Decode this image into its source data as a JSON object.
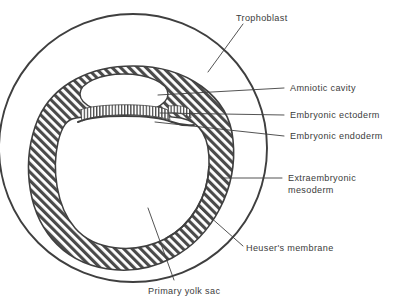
{
  "figure": {
    "type": "anatomical-cross-section",
    "colors": {
      "stroke": "#3f3f3f",
      "hatch": "#4a4a4a",
      "text": "#3b3b3b",
      "background": "#ffffff",
      "cavity_fill": "#ffffff"
    }
  },
  "labels": {
    "trophoblast": "Trophoblast",
    "amniotic_cavity": "Amniotic cavity",
    "embryonic_ectoderm": "Embryonic ectoderm",
    "embryonic_endoderm": "Embryonic endoderm",
    "extraembryonic_mesoderm_line1": "Extraembryonic",
    "extraembryonic_mesoderm_line2": "mesoderm",
    "heusers_membrane": "Heuser's membrane",
    "primary_yolk_sac": "Primary yolk sac"
  },
  "structures": {
    "trophoblast": {
      "name": "Trophoblast",
      "shape": "outer-circle",
      "center_x": 133,
      "center_y": 148,
      "radius": 134,
      "fill": "none"
    },
    "extraembryonic_mesoderm": {
      "name": "Extraembryonic mesoderm",
      "shape": "hatched-ring",
      "pattern": "diagonal-hatch"
    },
    "amniotic_cavity": {
      "name": "Amniotic cavity",
      "shape": "oval-cavity",
      "fill": "white"
    },
    "embryonic_ectoderm": {
      "name": "Embryonic ectoderm",
      "pattern": "vertical-stripes"
    },
    "embryonic_endoderm": {
      "name": "Embryonic endoderm",
      "pattern": "solid-line"
    },
    "heusers_membrane": {
      "name": "Heuser's membrane",
      "pattern": "thin-line"
    },
    "primary_yolk_sac": {
      "name": "Primary yolk sac",
      "shape": "large-cavity",
      "fill": "white"
    }
  }
}
